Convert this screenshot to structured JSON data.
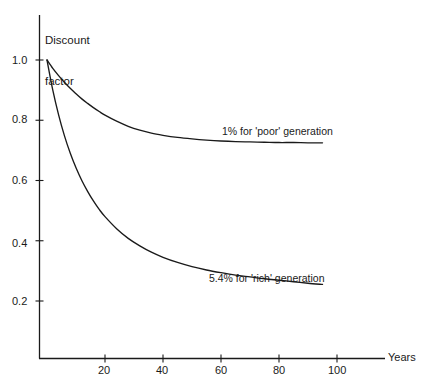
{
  "figure": {
    "background_color": "#ffffff",
    "ink_color": "#1a1a1a",
    "width": 430,
    "height": 389
  },
  "axes": {
    "y_axis_title_line1": "Discount",
    "y_axis_title_line2": "factor",
    "x_axis_title": "Years",
    "y_tick_labels": [
      "1.0",
      "0.8",
      "0.6",
      "0.4",
      "0.2"
    ],
    "x_tick_labels": [
      "20",
      "40",
      "60",
      "80",
      "100"
    ]
  },
  "annotations": {
    "poor_curve_label": "1% for 'poor' generation",
    "rich_curve_label": "5.4% for 'rich' generation"
  },
  "chart_data": {
    "type": "line",
    "title": "",
    "subtitle": "",
    "xlabel": "Years",
    "ylabel": "Discount factor",
    "xlim": [
      0,
      110
    ],
    "ylim": [
      0,
      1.08
    ],
    "grid": false,
    "legend": "inline-annotations",
    "x_ticks": [
      20,
      40,
      60,
      80,
      100
    ],
    "y_ticks": [
      0.2,
      0.4,
      0.6,
      0.8,
      1.0
    ],
    "x": [
      0,
      2,
      4,
      6,
      8,
      10,
      12,
      14,
      16,
      18,
      20,
      24,
      28,
      32,
      36,
      40,
      45,
      50,
      55,
      60,
      65,
      70,
      75,
      80,
      85,
      90,
      95
    ],
    "series": [
      {
        "name": "1% for 'poor' generation",
        "label": "1% for 'poor' generation",
        "asymptote": 0.725,
        "start_value": 1.0,
        "color": "#1a1a1a",
        "values": [
          1.0,
          0.972,
          0.948,
          0.926,
          0.906,
          0.888,
          0.871,
          0.856,
          0.842,
          0.829,
          0.817,
          0.797,
          0.78,
          0.767,
          0.757,
          0.75,
          0.743,
          0.738,
          0.734,
          0.731,
          0.729,
          0.728,
          0.727,
          0.726,
          0.726,
          0.725,
          0.725
        ]
      },
      {
        "name": "5.4% for 'rich' generation",
        "label": "5.4% for 'rich' generation",
        "asymptote": 0.225,
        "start_value": 1.0,
        "color": "#1a1a1a",
        "values": [
          1.0,
          0.9,
          0.818,
          0.749,
          0.691,
          0.642,
          0.6,
          0.564,
          0.532,
          0.504,
          0.48,
          0.44,
          0.408,
          0.383,
          0.362,
          0.345,
          0.328,
          0.314,
          0.303,
          0.294,
          0.286,
          0.28,
          0.274,
          0.269,
          0.264,
          0.259,
          0.255
        ]
      }
    ]
  }
}
